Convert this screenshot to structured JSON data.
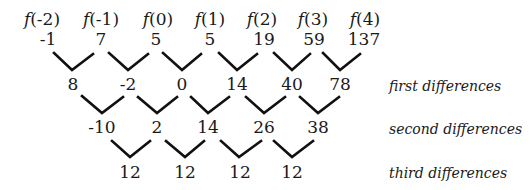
{
  "diagram": {
    "function_labels": [
      "f(-2)",
      "f(-1)",
      "f(0)",
      "f(1)",
      "f(2)",
      "f(3)",
      "f(4)"
    ],
    "values": [
      "-1",
      "7",
      "5",
      "5",
      "19",
      "59",
      "137"
    ],
    "first_differences": [
      "8",
      "-2",
      "0",
      "14",
      "40",
      "78"
    ],
    "second_differences": [
      "-10",
      "2",
      "14",
      "26",
      "38"
    ],
    "third_differences": [
      "12",
      "12",
      "12",
      "12"
    ],
    "row_labels": {
      "first": "first differences",
      "second": "second differences",
      "third": "third differences"
    }
  }
}
